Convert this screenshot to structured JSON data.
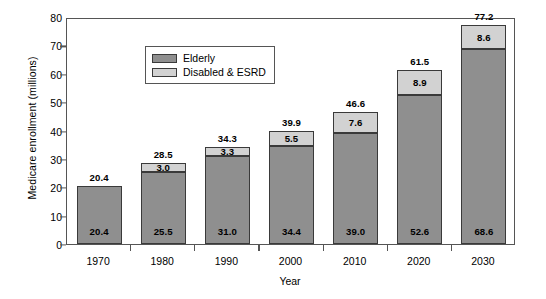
{
  "chart_data": {
    "type": "bar",
    "subtype": "stacked-vertical-bar",
    "title": "",
    "xlabel": "Year",
    "ylabel": "Medicare enrollment (millions)",
    "categories": [
      "1970",
      "1980",
      "1990",
      "2000",
      "2010",
      "2020",
      "2030"
    ],
    "series": [
      {
        "name": "Elderly",
        "color": "#8f8f8f",
        "values": [
          20.4,
          25.5,
          31.0,
          34.4,
          39.0,
          52.6,
          68.6
        ],
        "labels": [
          "20.4",
          "25.5",
          "31.0",
          "34.4",
          "39.0",
          "52.6",
          "68.6"
        ]
      },
      {
        "name": "Disabled & ESRD",
        "color": "#d2d2d2",
        "values": [
          0.0,
          3.0,
          3.3,
          5.5,
          7.6,
          8.9,
          8.6
        ],
        "labels": [
          "",
          "3.0",
          "3.3",
          "5.5",
          "7.6",
          "8.9",
          "8.6"
        ]
      }
    ],
    "totals": [
      20.4,
      28.5,
      34.3,
      39.9,
      46.6,
      61.5,
      77.2
    ],
    "total_labels": [
      "20.4",
      "28.5",
      "34.3",
      "39.9",
      "46.6",
      "61.5",
      "77.2"
    ],
    "ylim": [
      0,
      80
    ],
    "yticks": [
      0,
      10,
      20,
      30,
      40,
      50,
      60,
      70,
      80
    ],
    "ytick_labels": [
      "0",
      "10",
      "20",
      "30",
      "40",
      "50",
      "60",
      "70",
      "80"
    ],
    "grid": false,
    "legend_position": "top-left",
    "legend_entries": [
      "Elderly",
      "Disabled & ESRD"
    ]
  },
  "legend": {
    "items": [
      {
        "label": "Elderly",
        "color": "#8f8f8f"
      },
      {
        "label": "Disabled & ESRD",
        "color": "#d2d2d2"
      }
    ]
  },
  "axes": {
    "y_title": "Medicare enrollment (millions)",
    "x_title": "Year"
  }
}
